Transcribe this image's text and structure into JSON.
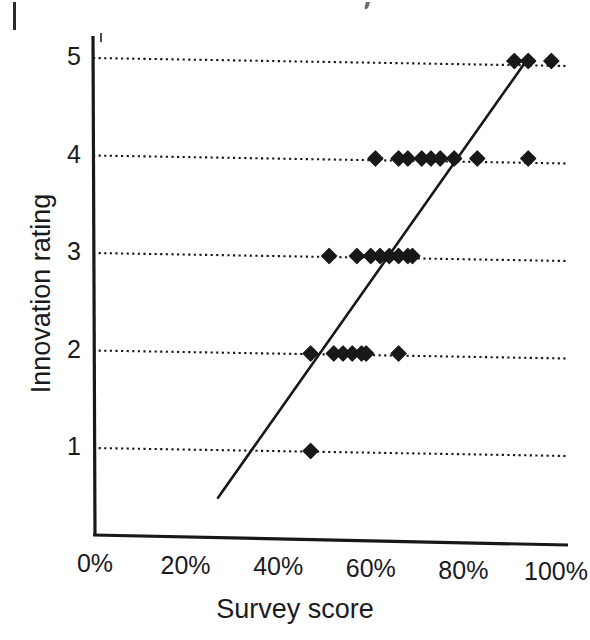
{
  "figure": {
    "kind": "scatter-plot",
    "background_color": "#ffffff",
    "ink_color": "#1a1b1d"
  },
  "axis": {
    "x_title": "Survey score",
    "y_title": "Innovation rating",
    "x_ticks": [
      {
        "label": "0%",
        "value": 0
      },
      {
        "label": "20%",
        "value": 20
      },
      {
        "label": "40%",
        "value": 40
      },
      {
        "label": "60%",
        "value": 60
      },
      {
        "label": "80%",
        "value": 80
      },
      {
        "label": "100%",
        "value": 100
      }
    ],
    "y_ticks": [
      {
        "label": "1",
        "value": 1
      },
      {
        "label": "2",
        "value": 2
      },
      {
        "label": "3",
        "value": 3
      },
      {
        "label": "4",
        "value": 4
      },
      {
        "label": "5",
        "value": 5
      }
    ]
  },
  "chart_data": {
    "type": "scatter",
    "title": "",
    "subtitle": "",
    "xlabel": "Survey score",
    "ylabel": "Innovation rating",
    "xlim": [
      0,
      100
    ],
    "ylim": [
      0.25,
      5.25
    ],
    "x_unit": "percent",
    "grid": true,
    "grid_orientation": "horizontal",
    "grid_style": "dotted",
    "grid_values": [
      1,
      2,
      3,
      4,
      5
    ],
    "legend": null,
    "legend_position": "none",
    "marker": "diamond",
    "marker_color": "#17181a",
    "marker_size_px": 15,
    "series": [
      {
        "name": "Survey respondents",
        "points": [
          {
            "x": 47,
            "y": 1
          },
          {
            "x": 47,
            "y": 2
          },
          {
            "x": 52,
            "y": 2
          },
          {
            "x": 54,
            "y": 2
          },
          {
            "x": 56,
            "y": 2
          },
          {
            "x": 58,
            "y": 2
          },
          {
            "x": 59,
            "y": 2
          },
          {
            "x": 66,
            "y": 2
          },
          {
            "x": 51,
            "y": 3
          },
          {
            "x": 57,
            "y": 3
          },
          {
            "x": 60,
            "y": 3
          },
          {
            "x": 62,
            "y": 3
          },
          {
            "x": 64,
            "y": 3
          },
          {
            "x": 66,
            "y": 3
          },
          {
            "x": 68,
            "y": 3
          },
          {
            "x": 69,
            "y": 3
          },
          {
            "x": 61,
            "y": 4
          },
          {
            "x": 66,
            "y": 4
          },
          {
            "x": 68,
            "y": 4
          },
          {
            "x": 71,
            "y": 4
          },
          {
            "x": 73,
            "y": 4
          },
          {
            "x": 75,
            "y": 4
          },
          {
            "x": 78,
            "y": 4
          },
          {
            "x": 83,
            "y": 4
          },
          {
            "x": 94,
            "y": 4
          },
          {
            "x": 91,
            "y": 5
          },
          {
            "x": 94,
            "y": 5
          },
          {
            "x": 99,
            "y": 5
          }
        ]
      }
    ],
    "trendline": {
      "name": "fit line",
      "style": "solid",
      "color": "#17181a",
      "x_start": 27,
      "y_start": 0.49,
      "x_end": 94,
      "y_end": 5.0
    }
  }
}
